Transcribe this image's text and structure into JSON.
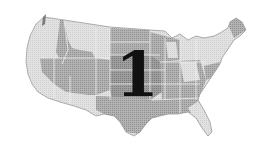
{
  "illustration": {
    "subject": "United States map",
    "style": "grayscale halftone",
    "overlay_numeral": "1",
    "colors": {
      "background": "#ffffff",
      "light_region": "#d9d9d9",
      "mid_region": "#a6a6a6",
      "dark_region": "#8c8c8c",
      "outline": "#6e6e6e",
      "numeral": "#111111"
    }
  }
}
